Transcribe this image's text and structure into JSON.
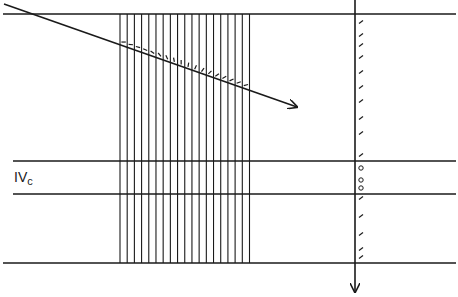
{
  "diagram": {
    "width": 458,
    "height": 297,
    "background": "#ffffff",
    "stroke_color": "#1a1a1a",
    "layer_label": {
      "main": "IV",
      "sub": "c",
      "x": 14,
      "y": 170
    },
    "horizontal_lines": [
      {
        "name": "top-boundary",
        "x1": 3,
        "x2": 456,
        "y": 14
      },
      {
        "name": "layer-ivc-top",
        "x1": 13,
        "x2": 456,
        "y": 161
      },
      {
        "name": "layer-ivc-bottom",
        "x1": 13,
        "x2": 456,
        "y": 194
      },
      {
        "name": "bottom-boundary",
        "x1": 3,
        "x2": 456,
        "y": 263
      }
    ],
    "vertical_grating": {
      "count": 19,
      "x_start": 120,
      "x_end": 249.5,
      "y_top": 14,
      "y_bottom": 263
    },
    "diagonal_arrow": {
      "x1": 4,
      "y1": 4,
      "x2": 297,
      "y2": 107
    },
    "diagonal_ticks": {
      "description": "orientation markers in each gap just above the diagonal, rotating from horizontal to vertical to oblique",
      "angles_deg": [
        0,
        5,
        15,
        25,
        35,
        50,
        65,
        80,
        90,
        -80,
        -65,
        -55,
        -45,
        -35,
        -30,
        -25,
        -20,
        -15
      ]
    },
    "vertical_arrow": {
      "x": 355,
      "y1": 0,
      "y2": 292
    },
    "vertical_markers": {
      "x": 361,
      "ticks_y": [
        22,
        35,
        45,
        57,
        72,
        87,
        101,
        118,
        133,
        155,
        198,
        216,
        234,
        249,
        257
      ],
      "circles_y": [
        168,
        180,
        188
      ]
    }
  }
}
